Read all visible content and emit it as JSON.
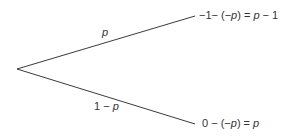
{
  "diagram": {
    "type": "probability-tree",
    "root": {
      "x": 17,
      "y": 69
    },
    "line_color": "#3a3a3a",
    "branches": [
      {
        "id": "top",
        "end": {
          "x": 195,
          "y": 16
        },
        "probability_label": "p",
        "outcome": {
          "part1": "−1− (−",
          "var1": "p",
          "part2": ") = ",
          "var2": "p",
          "part3": " − 1"
        },
        "outcome_text": "−1− (−p) = p − 1"
      },
      {
        "id": "bottom",
        "end": {
          "x": 195,
          "y": 124
        },
        "probability_label_prefix": "1 − ",
        "probability_label_var": "p",
        "outcome": {
          "part1": "0 − (−",
          "var1": "p",
          "part2": ") = ",
          "var2": "p"
        },
        "outcome_text": "0 − (−p) = p"
      }
    ]
  }
}
